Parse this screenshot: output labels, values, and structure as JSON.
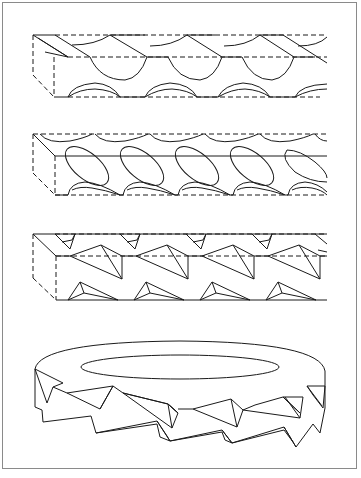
{
  "figure": {
    "colors": {
      "line": "#1a1a1a",
      "frame": "#8a8a8a",
      "background": "#ffffff"
    },
    "panels": [
      {
        "id": "panel-1",
        "label": "Bar with helical scalloped cuts",
        "pattern": "scallop",
        "repeat_px": 71
      },
      {
        "id": "panel-2",
        "label": "Bar with inclined elliptical cuts",
        "pattern": "ellipse",
        "repeat_px": 55
      },
      {
        "id": "panel-3",
        "label": "Bar with pyramidal / triangular serrations",
        "pattern": "triangle",
        "repeat_px": 66
      },
      {
        "id": "panel-4",
        "label": "Ring with triangular serrated rim",
        "pattern": "serrated-ring"
      }
    ]
  }
}
